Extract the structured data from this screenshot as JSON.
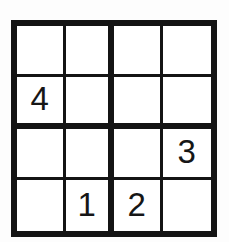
{
  "puzzle": {
    "title": "Sudoku 4x4",
    "size": 4,
    "box_rows": 2,
    "box_cols": 2,
    "colors": {
      "page_background": "#fdfdfd",
      "cell_background": "#ffffff",
      "line": "#141414",
      "digit": "#161616"
    },
    "lines": {
      "outer_border_px": 6,
      "box_divider_px": 6,
      "cell_divider_px": 3
    },
    "rows": [
      [
        {
          "row": 1,
          "col": 1,
          "value": "",
          "given": false
        },
        {
          "row": 1,
          "col": 2,
          "value": "",
          "given": false
        },
        {
          "row": 1,
          "col": 3,
          "value": "",
          "given": false
        },
        {
          "row": 1,
          "col": 4,
          "value": "",
          "given": false
        }
      ],
      [
        {
          "row": 2,
          "col": 1,
          "value": "4",
          "given": true
        },
        {
          "row": 2,
          "col": 2,
          "value": "",
          "given": false
        },
        {
          "row": 2,
          "col": 3,
          "value": "",
          "given": false
        },
        {
          "row": 2,
          "col": 4,
          "value": "",
          "given": false
        }
      ],
      [
        {
          "row": 3,
          "col": 1,
          "value": "",
          "given": false
        },
        {
          "row": 3,
          "col": 2,
          "value": "",
          "given": false
        },
        {
          "row": 3,
          "col": 3,
          "value": "",
          "given": false
        },
        {
          "row": 3,
          "col": 4,
          "value": "3",
          "given": true
        }
      ],
      [
        {
          "row": 4,
          "col": 1,
          "value": "",
          "given": false
        },
        {
          "row": 4,
          "col": 2,
          "value": "1",
          "given": true
        },
        {
          "row": 4,
          "col": 3,
          "value": "2",
          "given": true
        },
        {
          "row": 4,
          "col": 4,
          "value": "",
          "given": false
        }
      ]
    ]
  }
}
